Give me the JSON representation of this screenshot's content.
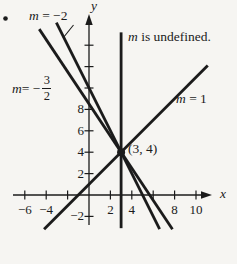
{
  "figure": {
    "colors": {
      "bg": "#f6f5f2",
      "ink": "#1b1b1b"
    },
    "labels": {
      "slope_neg2": {
        "var": "m",
        "rest": " = −2"
      },
      "slope_neg32": {
        "var": "m",
        "rest": " = −",
        "num": "3",
        "den": "2"
      },
      "slope_1": {
        "var": "m",
        "rest": " = 1"
      },
      "undefined_slope": {
        "var": "m",
        "rest": " is undefined."
      },
      "point": "(3, 4)",
      "x_axis": "x",
      "y_axis": "y"
    }
  },
  "graph": {
    "mapping": {
      "origin_px": {
        "x": 89,
        "y": 195
      },
      "unit_px": 10.7
    },
    "axes": {
      "x_line": {
        "x1": 13,
        "x2": 204
      },
      "y_line": {
        "y1": 24,
        "y2": 225
      },
      "x_arrow_tip": {
        "x": 212,
        "y": 195
      },
      "y_arrow_tip": {
        "x": 89,
        "y": 14
      }
    },
    "tick_half_px": 4.5,
    "x_ticks": [
      -6,
      -4,
      -2,
      2,
      4,
      6,
      8,
      10
    ],
    "y_ticks": [
      -2,
      2,
      4,
      6,
      8,
      10,
      12,
      14
    ],
    "x_tick_labels": [
      {
        "value": -6,
        "text": "−6"
      },
      {
        "value": -4,
        "text": "−4"
      },
      {
        "value": 2,
        "text": "2"
      },
      {
        "value": 4,
        "text": "4"
      },
      {
        "value": 8,
        "text": "8"
      },
      {
        "value": 10,
        "text": "10"
      }
    ],
    "y_tick_labels": [
      {
        "value": 8,
        "text": "8"
      },
      {
        "value": 6,
        "text": "6"
      },
      {
        "value": 4,
        "text": "4"
      },
      {
        "value": 2,
        "text": "2"
      },
      {
        "value": -2,
        "text": "−2"
      }
    ],
    "lines": [
      {
        "id": "line-slope-1",
        "slope": "1",
        "x1": -4.2,
        "y1": -3.2,
        "x2": 11.1,
        "y2": 12.1
      },
      {
        "id": "line-slope-neg2",
        "slope": "-2",
        "x1": -3.05,
        "y1": 16.1,
        "x2": 6.6,
        "y2": -3.2
      },
      {
        "id": "line-slope-neg-3-2",
        "slope": "-3/2",
        "x1": -4.65,
        "y1": 15.5,
        "x2": 7.8,
        "y2": -3.2
      },
      {
        "id": "line-undefined",
        "slope": "undefined",
        "x1": 3,
        "y1": 15.2,
        "x2": 3,
        "y2": -3.1
      }
    ],
    "point": {
      "x": 3,
      "y": 4,
      "r_px": 4
    },
    "leader_px": {
      "x1": 63,
      "y1": 38,
      "x2": 73.5,
      "y2": 25
    },
    "bullet_px": {
      "x": 5.5,
      "y": 18.5,
      "r": 2.3
    }
  }
}
